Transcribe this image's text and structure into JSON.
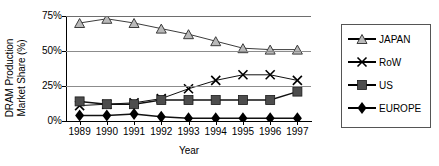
{
  "chart_data": {
    "type": "line",
    "title": "",
    "xlabel": "Year",
    "ylabel": "DRAM Production Market Share (%)",
    "ylabel_line1": "DRAM Production",
    "ylabel_line2": "Market Share (%)",
    "categories": [
      "1989",
      "1990",
      "1991",
      "1992",
      "1993",
      "1994",
      "1995",
      "1996",
      "1997"
    ],
    "ylim": [
      0,
      75
    ],
    "yticks": [
      0,
      25,
      50,
      75
    ],
    "ytick_labels": [
      "0%",
      "25%",
      "50%",
      "75%"
    ],
    "grid": true,
    "legend_position": "right",
    "series": [
      {
        "name": "JAPAN",
        "marker": "triangle",
        "color": "#4a4a4a",
        "values": [
          70,
          73,
          70,
          66,
          62,
          57,
          52,
          51,
          51
        ]
      },
      {
        "name": "RoW",
        "marker": "x",
        "color": "#000000",
        "values": [
          11,
          12,
          13,
          16,
          23,
          29,
          33,
          33,
          29
        ]
      },
      {
        "name": "US",
        "marker": "square",
        "color": "#4d4d4d",
        "values": [
          14,
          12,
          12,
          15,
          15,
          15,
          15,
          15,
          21
        ]
      },
      {
        "name": "EUROPE",
        "marker": "diamond",
        "color": "#000000",
        "values": [
          4,
          4,
          5,
          3,
          2,
          2,
          2,
          2,
          2
        ]
      }
    ]
  },
  "legend": {
    "items": [
      {
        "label": "JAPAN",
        "marker": "triangle-icon"
      },
      {
        "label": "RoW",
        "marker": "x-icon"
      },
      {
        "label": "US",
        "marker": "square-icon"
      },
      {
        "label": "EUROPE",
        "marker": "diamond-icon"
      }
    ]
  }
}
